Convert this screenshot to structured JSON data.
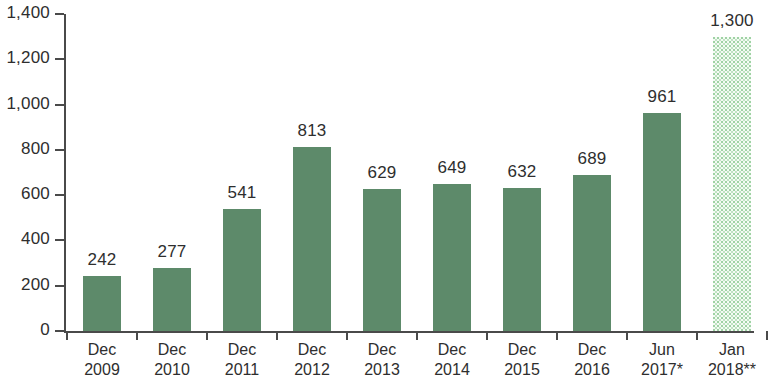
{
  "chart_data": {
    "type": "bar",
    "title": "",
    "subtitle": "",
    "xlabel": "",
    "ylabel": "",
    "ylim": [
      0,
      1400
    ],
    "ytick_step": 200,
    "grid": false,
    "legend": false,
    "categories": [
      "Dec 2009",
      "Dec 2010",
      "Dec 2011",
      "Dec 2012",
      "Dec 2013",
      "Dec 2014",
      "Dec 2015",
      "Dec 2016",
      "Jun 2017*",
      "Jan 2018**"
    ],
    "category_lines": [
      {
        "line1": "Dec",
        "line2": "2009"
      },
      {
        "line1": "Dec",
        "line2": "2010"
      },
      {
        "line1": "Dec",
        "line2": "2011"
      },
      {
        "line1": "Dec",
        "line2": "2012"
      },
      {
        "line1": "Dec",
        "line2": "2013"
      },
      {
        "line1": "Dec",
        "line2": "2014"
      },
      {
        "line1": "Dec",
        "line2": "2015"
      },
      {
        "line1": "Dec",
        "line2": "2016"
      },
      {
        "line1": "Jun",
        "line2": "2017*"
      },
      {
        "line1": "Jan",
        "line2": "2018**"
      }
    ],
    "values": [
      242,
      277,
      541,
      813,
      629,
      649,
      632,
      689,
      961,
      1300
    ],
    "value_labels": [
      "242",
      "277",
      "541",
      "813",
      "629",
      "649",
      "632",
      "689",
      "961",
      "1,300"
    ],
    "bar_styles": [
      "solid",
      "solid",
      "solid",
      "solid",
      "solid",
      "solid",
      "solid",
      "solid",
      "solid",
      "projected"
    ],
    "ytick_labels": [
      "0",
      "200",
      "400",
      "600",
      "800",
      "1,000",
      "1,200",
      "1,400"
    ],
    "ytick_values": [
      0,
      200,
      400,
      600,
      800,
      1000,
      1200,
      1400
    ],
    "colors": {
      "bar_solid": "#5d8a6a",
      "bar_projected_dots": "#9fd2a4",
      "bar_projected_bg": "#f4fbf4",
      "axis": "#4a4a4a",
      "text": "#2e2e2e",
      "background": "#ffffff"
    }
  }
}
